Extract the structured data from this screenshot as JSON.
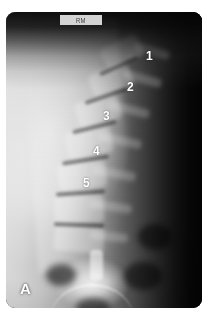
{
  "figure": {
    "panel_letter": "A",
    "modality": "lateral lumbar spine radiograph",
    "background_color": "#ffffff",
    "plate_color": "#070707",
    "label_color": "#ffffff"
  },
  "marker": {
    "text": "RM",
    "description": "radiographic side marker strip at top of film"
  },
  "labels": [
    {
      "text": "1",
      "x": 146,
      "y": 50,
      "anatomy": "L1 vertebra"
    },
    {
      "text": "2",
      "x": 127,
      "y": 81,
      "anatomy": "L2 vertebra"
    },
    {
      "text": "3",
      "x": 103,
      "y": 110,
      "anatomy": "L3 vertebra"
    },
    {
      "text": "4",
      "x": 93,
      "y": 145,
      "anatomy": "L4 vertebra"
    },
    {
      "text": "5",
      "x": 83,
      "y": 177,
      "anatomy": "L5 vertebra"
    }
  ],
  "vertebrae": [
    {
      "left": 96,
      "top": 28,
      "width": 40,
      "height": 24,
      "rot": -26
    },
    {
      "left": 84,
      "top": 56,
      "width": 42,
      "height": 25,
      "rot": -21
    },
    {
      "left": 70,
      "top": 86,
      "width": 44,
      "height": 26,
      "rot": -16
    },
    {
      "left": 60,
      "top": 117,
      "width": 46,
      "height": 27,
      "rot": -11
    },
    {
      "left": 52,
      "top": 150,
      "width": 48,
      "height": 27,
      "rot": -6
    },
    {
      "left": 48,
      "top": 183,
      "width": 50,
      "height": 28,
      "rot": -2
    },
    {
      "left": 48,
      "top": 214,
      "width": 50,
      "height": 26,
      "rot": 4
    }
  ],
  "discs": [
    {
      "left": 92,
      "top": 52,
      "width": 42,
      "height": 4,
      "rot": -24
    },
    {
      "left": 78,
      "top": 82,
      "width": 44,
      "height": 4,
      "rot": -19
    },
    {
      "left": 66,
      "top": 113,
      "width": 45,
      "height": 4,
      "rot": -14
    },
    {
      "left": 56,
      "top": 146,
      "width": 47,
      "height": 4,
      "rot": -9
    },
    {
      "left": 50,
      "top": 179,
      "width": 49,
      "height": 4,
      "rot": -4
    },
    {
      "left": 48,
      "top": 211,
      "width": 50,
      "height": 4,
      "rot": 2
    }
  ],
  "processes": [
    {
      "left": 128,
      "top": 34,
      "width": 36,
      "height": 9,
      "rot": 18
    },
    {
      "left": 116,
      "top": 62,
      "width": 40,
      "height": 9,
      "rot": 16
    },
    {
      "left": 102,
      "top": 93,
      "width": 42,
      "height": 9,
      "rot": 14
    },
    {
      "left": 92,
      "top": 124,
      "width": 44,
      "height": 9,
      "rot": 12
    },
    {
      "left": 86,
      "top": 157,
      "width": 44,
      "height": 9,
      "rot": 10
    },
    {
      "left": 84,
      "top": 190,
      "width": 42,
      "height": 9,
      "rot": 8
    },
    {
      "left": 84,
      "top": 220,
      "width": 38,
      "height": 9,
      "rot": 6
    }
  ],
  "gas_pockets": [
    {
      "left": 118,
      "top": 250,
      "width": 38,
      "height": 28
    },
    {
      "left": 40,
      "top": 252,
      "width": 30,
      "height": 22
    },
    {
      "left": 132,
      "top": 212,
      "width": 34,
      "height": 26
    },
    {
      "left": 70,
      "top": 286,
      "width": 34,
      "height": 18
    }
  ]
}
